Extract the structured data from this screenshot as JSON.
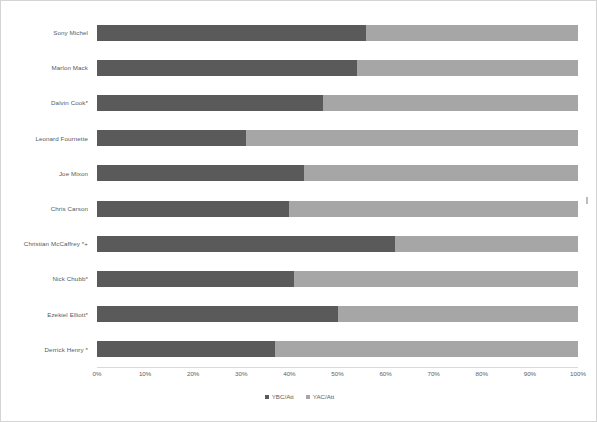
{
  "chart_data": {
    "type": "bar",
    "orientation": "horizontal",
    "stacked": true,
    "normalized": "100%",
    "title": "",
    "subtitle": "",
    "xlabel": "",
    "ylabel": "",
    "xlim": [
      0,
      100
    ],
    "grid": false,
    "legend_position": "bottom-center",
    "categories": [
      "Sony Michel",
      "Marlon Mack",
      "Dalvin Cook*",
      "Leonard Fournette",
      "Joe Mixon",
      "Chris Carson",
      "Christian McCaffrey *+",
      "Nick Chubb*",
      "Ezekiel Elliott*",
      "Derrick Henry *"
    ],
    "xticks": [
      "0%",
      "10%",
      "20%",
      "30%",
      "40%",
      "50%",
      "60%",
      "70%",
      "80%",
      "90%",
      "100%"
    ],
    "series": [
      {
        "name": "YBC/Att",
        "color": "#5a5a5a",
        "values": [
          56,
          54,
          47,
          31,
          43,
          40,
          62,
          41,
          50,
          37
        ]
      },
      {
        "name": "YAC/Att",
        "color": "#a6a6a6",
        "values": [
          44,
          46,
          53,
          69,
          57,
          60,
          38,
          59,
          50,
          63
        ]
      }
    ]
  },
  "legend": {
    "items": [
      {
        "label": "YBC/Att",
        "swatch": "ybc"
      },
      {
        "label": "YAC/Att",
        "swatch": "yac"
      }
    ]
  },
  "colors": {
    "ybc": "#5a5a5a",
    "yac": "#a6a6a6",
    "axis_text": "#5e5e5e",
    "border": "#d4d4d4"
  }
}
